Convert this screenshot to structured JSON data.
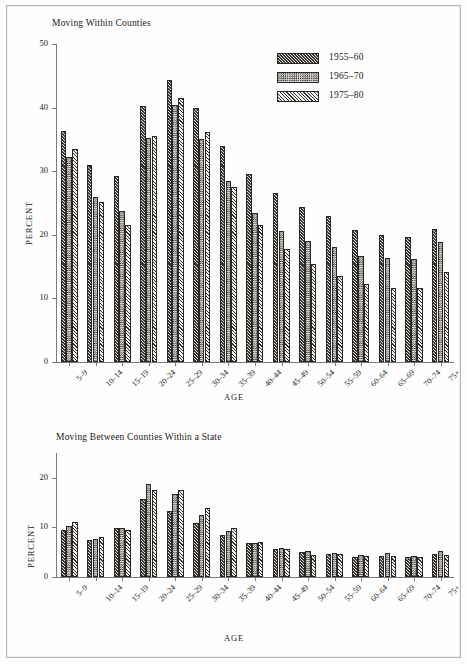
{
  "figure": {
    "legend": {
      "entries": [
        {
          "label": "1955–60",
          "pattern": "dark-diagonal-hatch"
        },
        {
          "label": "1965–70",
          "pattern": "light-stipple"
        },
        {
          "label": "1975–80",
          "pattern": "white-diagonal-hatch"
        }
      ]
    }
  },
  "chart_data": [
    {
      "type": "bar",
      "id": "moving-within-counties",
      "title": "Moving Within Counties",
      "xlabel": "AGE",
      "ylabel": "PERCENT",
      "ylim": [
        0,
        50
      ],
      "yticks": [
        0,
        10,
        20,
        30,
        40,
        50
      ],
      "grid": false,
      "legend_position": "top-right",
      "categories": [
        "5–9",
        "10–14",
        "15–19",
        "20–24",
        "25–29",
        "30–34",
        "35–39",
        "40–44",
        "45–49",
        "50–54",
        "55–59",
        "60–64",
        "65–69",
        "70–74",
        "75+"
      ],
      "series": [
        {
          "name": "1955–60",
          "values": [
            36.3,
            31.0,
            29.2,
            40.3,
            44.4,
            40.0,
            34.0,
            29.6,
            26.5,
            24.4,
            22.9,
            20.8,
            19.9,
            19.7,
            20.9
          ]
        },
        {
          "name": "1965–70",
          "values": [
            32.3,
            26.0,
            23.8,
            35.2,
            40.4,
            35.0,
            28.4,
            23.4,
            20.6,
            19.1,
            18.1,
            16.7,
            16.3,
            16.2,
            18.8
          ]
        },
        {
          "name": "1975–80",
          "values": [
            33.5,
            25.1,
            21.6,
            35.6,
            41.5,
            36.1,
            27.5,
            21.5,
            17.7,
            15.4,
            13.5,
            12.2,
            11.6,
            11.7,
            14.2
          ]
        }
      ]
    },
    {
      "type": "bar",
      "id": "moving-between-counties-within-a-state",
      "title": "Moving Between Counties Within a State",
      "xlabel": "AGE",
      "ylabel": "PERCENT",
      "ylim": [
        0,
        25
      ],
      "yticks": [
        0,
        10,
        20
      ],
      "grid": false,
      "legend_position": "none",
      "categories": [
        "5–9",
        "10–14",
        "15–19",
        "20–24",
        "25–29",
        "30–34",
        "35–39",
        "40–44",
        "45–49",
        "50–54",
        "55–59",
        "60–64",
        "65–69",
        "70–74",
        "75+"
      ],
      "series": [
        {
          "name": "1955–60",
          "values": [
            9.5,
            7.4,
            9.8,
            15.7,
            13.4,
            10.9,
            8.5,
            6.8,
            5.6,
            5.0,
            4.6,
            4.1,
            4.2,
            4.0,
            4.6
          ]
        },
        {
          "name": "1965–70",
          "values": [
            10.3,
            7.6,
            9.8,
            18.8,
            16.8,
            12.5,
            9.2,
            6.9,
            5.8,
            5.2,
            4.8,
            4.5,
            4.9,
            4.2,
            5.3
          ]
        },
        {
          "name": "1975–80",
          "values": [
            11.1,
            8.0,
            9.4,
            17.6,
            17.6,
            14.0,
            9.8,
            7.0,
            5.6,
            4.4,
            4.6,
            4.3,
            4.3,
            4.1,
            4.5
          ]
        }
      ]
    }
  ]
}
